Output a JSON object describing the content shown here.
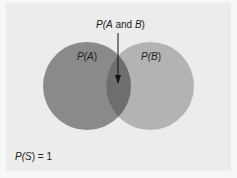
{
  "diagram": {
    "type": "venn",
    "sets": [
      {
        "name": "A",
        "label_prefix": "P(",
        "label_var": "A",
        "label_suffix": ")",
        "color": "#8a8a8a"
      },
      {
        "name": "B",
        "label_prefix": "P(",
        "label_var": "B",
        "label_suffix": ")",
        "color": "#b3b3b3"
      }
    ],
    "intersection": {
      "label_prefix": "P(",
      "label_var1": "A",
      "label_mid": " and ",
      "label_var2": "B",
      "label_suffix": ")",
      "color": "#6e6e6e"
    },
    "sample_space": {
      "label_prefix": "P(",
      "label_var": "S",
      "label_suffix": ") = 1"
    },
    "colors": {
      "background": "#ececec",
      "border": "#f7f7f7",
      "arrow": "#111111"
    }
  }
}
